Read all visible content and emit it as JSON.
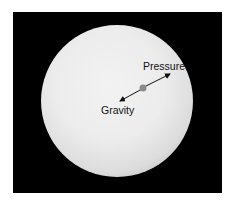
{
  "diagram": {
    "labels": {
      "pressure": "Pressure",
      "gravity": "Gravity"
    },
    "colors": {
      "background": "#000000",
      "sphere": "#ececec",
      "particle": "#8a8a8a",
      "arrow": "#111111"
    }
  }
}
